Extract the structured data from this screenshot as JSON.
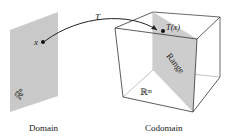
{
  "diagram": {
    "domain": {
      "caption": "Domain",
      "space_label": "ℝⁿ",
      "point_label": "x"
    },
    "mapping": {
      "label": "T"
    },
    "codomain": {
      "caption": "Codomain",
      "space_label": "ℝᵐ",
      "point_label": "T(x)",
      "subspace_label": "Range"
    },
    "colors": {
      "plane": "#c8c8c8",
      "range": "#cfcfcf",
      "line": "#333333"
    }
  }
}
